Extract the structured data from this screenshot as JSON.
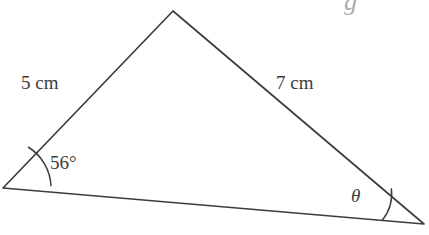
{
  "figure": {
    "type": "triangle-diagram",
    "background_color": "#ffffff",
    "stroke_color": "#3d3d3d",
    "text_color": "#3d3d3d",
    "vertices": {
      "apex": {
        "x": 173,
        "y": 11
      },
      "left": {
        "x": 3,
        "y": 188
      },
      "right": {
        "x": 424,
        "y": 224
      }
    },
    "labels": {
      "side_left": "5 cm",
      "side_right": "7 cm",
      "angle_left": "56°",
      "angle_right": "θ"
    },
    "angle_arcs": {
      "left": {
        "radius": 48,
        "vertex": "left"
      },
      "right": {
        "radius": 42,
        "vertex": "right"
      }
    },
    "artifacts": {
      "top_glyph_remnant": "g"
    }
  }
}
